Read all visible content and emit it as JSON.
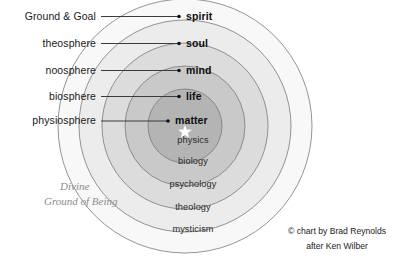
{
  "chart_data": {
    "type": "diagram",
    "center": {
      "x": 185,
      "y": 126
    },
    "rings": [
      {
        "level": "matter",
        "discipline": "physics",
        "sphere": "physiosphere",
        "radius": 37,
        "fill": "#b4b4b4"
      },
      {
        "level": "life",
        "discipline": "biology",
        "sphere": "biosphere",
        "radius": 60,
        "fill": "#c9c9c9"
      },
      {
        "level": "mind",
        "discipline": "psychology",
        "sphere": "noosphere",
        "radius": 83,
        "fill": "#dcdcdc"
      },
      {
        "level": "soul",
        "discipline": "theology",
        "sphere": "theosphere",
        "radius": 106,
        "fill": "#ececec"
      },
      {
        "level": "spirit",
        "discipline": "mysticism",
        "sphere": "Ground & Goal",
        "radius": 127,
        "fill": "#f8f8f8"
      }
    ],
    "annotations": [
      "Divine Ground of Being",
      "© chart by Brad Reynolds",
      "after Ken Wilber"
    ]
  },
  "left_labels": [
    {
      "text": "Ground & Goal",
      "x": 96,
      "y": 20,
      "line_y": 16.5,
      "dot_x": 179
    },
    {
      "text": "theosphere",
      "x": 96,
      "y": 47,
      "line_y": 43.5,
      "dot_x": 179
    },
    {
      "text": "noosphere",
      "x": 96,
      "y": 74,
      "line_y": 70.5,
      "dot_x": 179
    },
    {
      "text": "biosphere",
      "x": 96,
      "y": 100,
      "line_y": 96.5,
      "dot_x": 179
    },
    {
      "text": "physiosphere",
      "x": 96,
      "y": 124,
      "line_y": 121.0,
      "dot_x": 168
    }
  ],
  "level_labels": [
    {
      "text": "spirit",
      "x": 186,
      "y": 20
    },
    {
      "text": "soul",
      "x": 186,
      "y": 47
    },
    {
      "text": "mind",
      "x": 186,
      "y": 74
    },
    {
      "text": "life",
      "x": 186,
      "y": 100
    },
    {
      "text": "matter",
      "x": 175,
      "y": 124
    }
  ],
  "ring_labels": [
    {
      "text": "physics",
      "x": 193,
      "y": 143
    },
    {
      "text": "biology",
      "x": 193,
      "y": 164
    },
    {
      "text": "psychology",
      "x": 193,
      "y": 187
    },
    {
      "text": "theology",
      "x": 193,
      "y": 210
    },
    {
      "text": "mysticism",
      "x": 193,
      "y": 232
    }
  ],
  "ground_of_being": {
    "line1": "Divine",
    "line2": "Ground of Being",
    "x": 44,
    "y1": 190,
    "y2": 205
  },
  "credit": {
    "line1": "© chart by Brad Reynolds",
    "line2": "after Ken Wilber",
    "x": 337,
    "y1": 234,
    "y2": 249
  },
  "colors": {
    "background": "#ffffff",
    "outline": "#7a7a7a",
    "text": "#1a1a1a",
    "muted": "#8c8c8c"
  }
}
